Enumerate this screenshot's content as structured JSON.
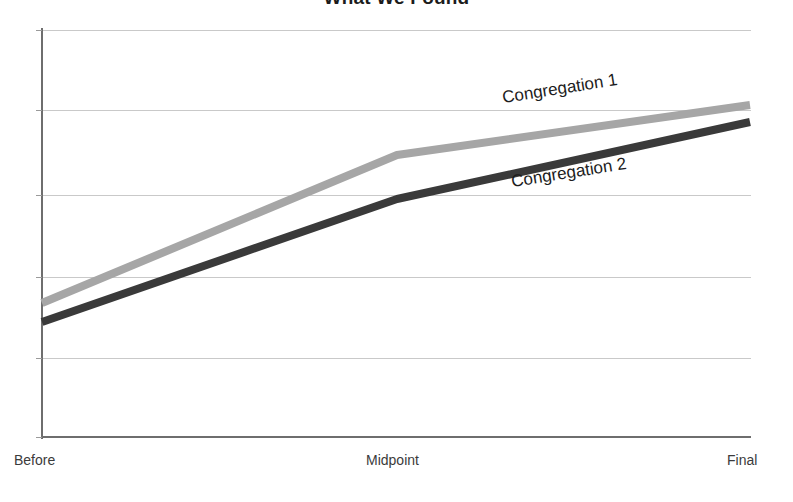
{
  "chart_data": {
    "type": "line",
    "title": "What We Found",
    "xlabel": "",
    "ylabel": "",
    "categories": [
      "Before",
      "Midpoint",
      "Final"
    ],
    "series": [
      {
        "name": "Congregation 1",
        "color": "#a6a6a6",
        "values": [
          33,
          70,
          82
        ],
        "points": [
          [
            42,
            303
          ],
          [
            397,
            155
          ],
          [
            750,
            105
          ]
        ]
      },
      {
        "name": "Congregation 2",
        "color": "#3a3a3a",
        "values": [
          28,
          59,
          78
        ],
        "points": [
          [
            42,
            322
          ],
          [
            397,
            199
          ],
          [
            750,
            122
          ]
        ]
      }
    ],
    "ylim": [
      0,
      100
    ],
    "grid": true,
    "gridline_y": [
      30,
      110,
      195,
      277,
      358
    ],
    "legend_position": "inline-on-lines",
    "axis_color": "#6e6e6e",
    "gridline_color": "#c9c9c9",
    "background": "#ffffff"
  },
  "labels": {
    "title": "What We Found",
    "category_before": "Before",
    "category_midpoint": "Midpoint",
    "category_final": "Final",
    "series_1": "Congregation 1",
    "series_2": "Congregation 2"
  }
}
